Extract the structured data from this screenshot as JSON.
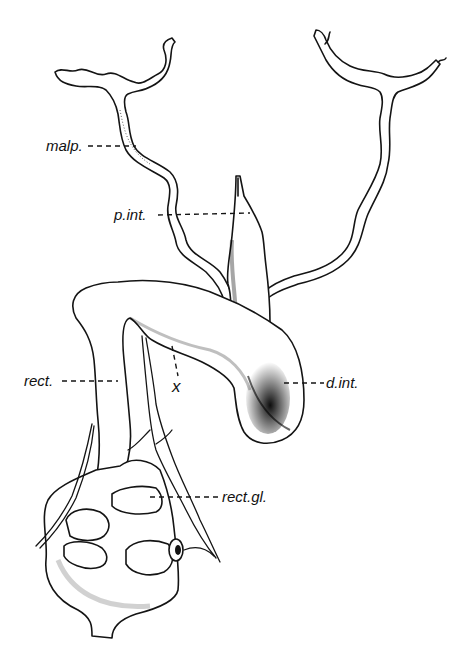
{
  "figure": {
    "type": "anatomical-illustration",
    "background_color": "#ffffff",
    "ink_color": "#141414"
  },
  "labels": {
    "malp": "malp.",
    "p_int": "p.int.",
    "rect": "rect.",
    "x_mark": "x",
    "d_int": "d.int.",
    "rect_gl": "rect.gl."
  }
}
